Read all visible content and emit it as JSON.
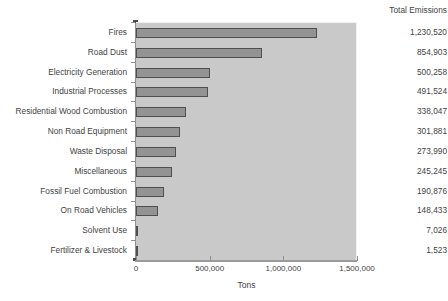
{
  "chart_data": {
    "type": "bar",
    "orientation": "horizontal",
    "title": "",
    "xlabel": "Tons",
    "ylabel": "",
    "xlim": [
      0,
      1500000
    ],
    "grid": false,
    "legend": null,
    "categories": [
      "Fires",
      "Road Dust",
      "Electricity Generation",
      "Industrial Processes",
      "Residential Wood Combustion",
      "Non Road Equipment",
      "Waste Disposal",
      "Miscellaneous",
      "Fossil Fuel Combustion",
      "On Road Vehicles",
      "Solvent Use",
      "Fertilizer & Livestock"
    ],
    "values": [
      1230520,
      854903,
      500258,
      491524,
      338047,
      301881,
      273990,
      245245,
      190876,
      148433,
      7026,
      1523
    ],
    "value_labels": [
      "1,230,520",
      "854,903",
      "500,258",
      "491,524",
      "338,047",
      "301,881",
      "273,990",
      "245,245",
      "190,876",
      "148,433",
      "7,026",
      "1,523"
    ],
    "xticks": [
      0,
      500000,
      1000000,
      1500000
    ],
    "xtick_labels": [
      "0",
      "500,000",
      "1,000,000",
      "1,500,000"
    ],
    "bar_color": "#939393",
    "bar_edge_color": "#4f4f4f",
    "plot_background": "#c9c9c9",
    "figure_background": "#ffffff"
  },
  "value_column": {
    "header": "Total Emissions"
  },
  "axis": {
    "x_title": "Tons"
  }
}
